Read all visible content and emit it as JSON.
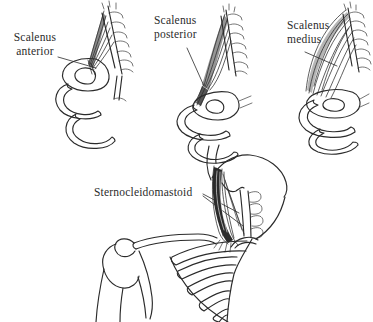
{
  "figure": {
    "background": "#ffffff",
    "ink_color": "#2b2b2b",
    "labels": {
      "anterior": "Scalenus anterior",
      "posterior": "Scalenus posterior",
      "medius": "Scalenus medius",
      "scm": "Sternocleidomastoid"
    }
  }
}
